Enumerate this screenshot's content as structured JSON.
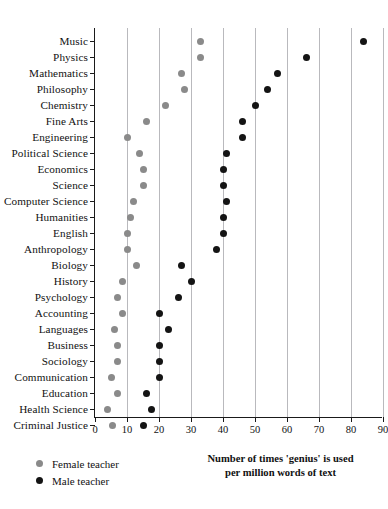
{
  "chart_data": {
    "type": "scatter",
    "orientation": "horizontal",
    "title": "",
    "xlabel": "Number of times 'genius' is used per million words of text",
    "xlabel_line1": "Number of times 'genius' is used",
    "xlabel_line2": "per million words of text",
    "ylabel": "",
    "xlim": [
      0,
      90
    ],
    "xticks": [
      0,
      10,
      20,
      30,
      40,
      50,
      60,
      70,
      80,
      90
    ],
    "xtick_labels": [
      "0",
      "10",
      "20",
      "30",
      "40",
      "50",
      "60",
      "70",
      "80",
      "90"
    ],
    "grid": "vertical",
    "legend_position": "bottom-left",
    "categories": [
      "Music",
      "Physics",
      "Mathematics",
      "Philosophy",
      "Chemistry",
      "Fine Arts",
      "Engineering",
      "Political Science",
      "Economics",
      "Science",
      "Computer Science",
      "Humanities",
      "English",
      "Anthropology",
      "Biology",
      "History",
      "Psychology",
      "Accounting",
      "Languages",
      "Business",
      "Sociology",
      "Communication",
      "Education",
      "Health Science",
      "Criminal Justice"
    ],
    "series": [
      {
        "name": "Female teacher",
        "color": "#8a8a8a",
        "marker": "circle",
        "values": [
          33,
          33,
          27,
          28,
          22,
          16,
          10,
          14,
          15,
          15,
          12,
          11,
          10,
          10,
          13,
          8.5,
          7,
          8.5,
          6,
          7,
          7,
          5,
          7,
          4,
          5.5
        ]
      },
      {
        "name": "Male teacher",
        "color": "#141414",
        "marker": "circle",
        "values": [
          84,
          66,
          57,
          54,
          50,
          46,
          46,
          41,
          40,
          40,
          41,
          40,
          40,
          38,
          27,
          30,
          26,
          20,
          23,
          20,
          20,
          20,
          16,
          17.5,
          15
        ]
      }
    ]
  },
  "legend": {
    "items": [
      {
        "label": "Female teacher",
        "swatch": "female-dot-icon"
      },
      {
        "label": "Male teacher",
        "swatch": "male-dot-icon"
      }
    ]
  }
}
